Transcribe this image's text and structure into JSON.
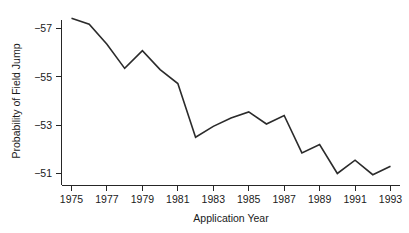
{
  "chart_data": {
    "type": "line",
    "title": "",
    "subtitle": "",
    "xlabel": "Application Year",
    "ylabel": "Probability of Field Jump",
    "grid": false,
    "legend": null,
    "xlim": [
      1975,
      1993
    ],
    "ylim": [
      -57.55,
      -50.55
    ],
    "y_axis_inverted": true,
    "xticks": [
      1975,
      1977,
      1979,
      1981,
      1983,
      1985,
      1987,
      1989,
      1991,
      1993
    ],
    "xtick_labels": [
      "1975",
      "1977",
      "1979",
      "1981",
      "1983",
      "1985",
      "1987",
      "1989",
      "1991",
      "1993"
    ],
    "yticks": [
      -57,
      -55,
      -53,
      -51
    ],
    "ytick_labels": [
      "−57",
      "−55",
      "−53",
      "−51"
    ],
    "x": [
      1975,
      1976,
      1977,
      1978,
      1979,
      1980,
      1981,
      1982,
      1983,
      1984,
      1985,
      1986,
      1987,
      1988,
      1989,
      1990,
      1991,
      1992,
      1993
    ],
    "series": [
      {
        "name": "Probability of Field Jump",
        "color": "#2b2b2b",
        "values": [
          -57.42,
          -57.18,
          -56.35,
          -55.35,
          -56.08,
          -55.3,
          -54.72,
          -52.5,
          -52.95,
          -53.3,
          -53.55,
          -53.05,
          -53.4,
          -51.85,
          -52.2,
          -51.0,
          -51.55,
          -50.95,
          -51.3
        ]
      }
    ]
  }
}
